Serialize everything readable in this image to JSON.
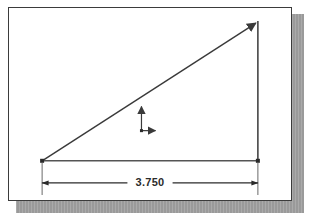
{
  "document": {
    "title": "Right triangle with horizontal dimension",
    "background_color": "#ffffff",
    "page_color": "#ffffff",
    "page_border_color": "#3b3b3b",
    "shadow_color": "#9a9a9a",
    "line_color": "#3a3a3a"
  },
  "drawing": {
    "geometry_name": "right-triangle",
    "vertices": {
      "bottom_left": {
        "label": "bottom-left-vertex",
        "x": 33,
        "y": 152
      },
      "bottom_right": {
        "label": "bottom-right-vertex",
        "x": 248,
        "y": 152
      },
      "top_right": {
        "label": "top-right-vertex",
        "x": 248,
        "y": 13
      }
    },
    "edges": [
      {
        "name": "hypotenuse",
        "from": "bottom_left",
        "to": "top_right",
        "has_arrowhead_at_end": true
      },
      {
        "name": "vertical-leg",
        "from": "top_right",
        "to": "bottom_right",
        "has_arrowhead_at_end": false
      },
      {
        "name": "base-leg",
        "from": "bottom_left",
        "to": "bottom_right",
        "has_arrowhead_at_end": false
      }
    ]
  },
  "ucs_icon": {
    "name": "ucs-coordinate-icon",
    "x": 132,
    "y": 98,
    "y_axis_label": "",
    "x_axis_label": "",
    "description": "L-shaped coordinate axis marker with arrowheads"
  },
  "dimension": {
    "name": "horizontal-dimension",
    "value": "3.750",
    "units": "",
    "line_y": 174,
    "start_x": 33,
    "end_x": 248,
    "extension_line_top_y": 152,
    "extension_line_bottom_y": 186,
    "arrow_style": "filled-tick-arrows"
  }
}
